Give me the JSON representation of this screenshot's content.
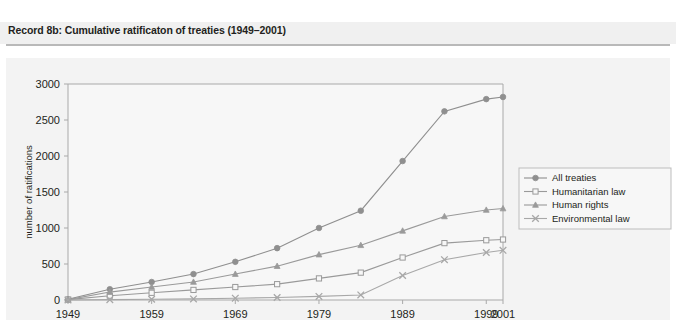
{
  "record": {
    "title": "Record 8b: Cumulative ratificaton of treaties (1949–2001)"
  },
  "colors": {
    "band": "#f0f0f0",
    "figure_band": "#f3f3f3",
    "plot_bg": "#f7f7f7",
    "axis": "#a9a9a9",
    "all_treaties": "#8f8f8f",
    "humanitarian_law": "#9a9a9a",
    "human_rights": "#9a9a9a",
    "environmental_law": "#a8a8a8",
    "text": "#231f20"
  },
  "chart_data": {
    "type": "line",
    "title": "Cumulative ratificaton of treaties (1949–2001)",
    "xlabel": "",
    "ylabel": "number of ratifications",
    "xlim": [
      1949,
      2001
    ],
    "ylim": [
      0,
      3000
    ],
    "yticks": [
      0,
      500,
      1000,
      1500,
      2000,
      2500,
      3000
    ],
    "ytick_labels": [
      "0",
      "500",
      "1000",
      "1500",
      "2000",
      "2500",
      "3000"
    ],
    "xticks": [
      1949,
      1959,
      1969,
      1979,
      1989,
      1999,
      2001
    ],
    "xtick_labels": [
      "1949",
      "1959",
      "1969",
      "1979",
      "1989",
      "1999",
      "2001"
    ],
    "grid": false,
    "legend_position": "right",
    "x": [
      1949,
      1954,
      1959,
      1964,
      1969,
      1974,
      1979,
      1984,
      1989,
      1994,
      1999,
      2001
    ],
    "series": [
      {
        "name": "All treaties",
        "marker": "filled-circle",
        "values": [
          10,
          150,
          250,
          360,
          530,
          720,
          1000,
          1240,
          1930,
          2620,
          2790,
          2820
        ]
      },
      {
        "name": "Humanitarian law",
        "marker": "open-square",
        "values": [
          5,
          60,
          100,
          140,
          180,
          220,
          300,
          380,
          590,
          790,
          830,
          840
        ]
      },
      {
        "name": "Human rights",
        "marker": "triangle",
        "values": [
          5,
          110,
          180,
          250,
          360,
          470,
          630,
          760,
          960,
          1160,
          1250,
          1270
        ]
      },
      {
        "name": "Environmental law",
        "marker": "cross-x",
        "values": [
          0,
          5,
          10,
          15,
          25,
          35,
          50,
          70,
          340,
          560,
          660,
          690
        ]
      }
    ],
    "legend": [
      "All treaties",
      "Humanitarian law",
      "Human rights",
      "Environmental law"
    ]
  }
}
